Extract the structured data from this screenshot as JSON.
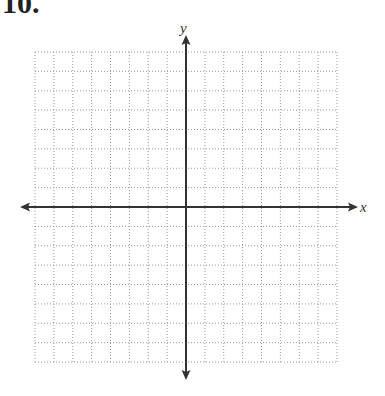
{
  "problem": {
    "number": "10."
  },
  "graph": {
    "x_axis_label": "x",
    "y_axis_label": "y",
    "grid": {
      "columns": 16,
      "rows": 16,
      "style": "dotted",
      "color": "#9a9a9a"
    },
    "axis_color": "#333333"
  },
  "chart_data": {
    "type": "scatter",
    "title": "",
    "xlabel": "x",
    "ylabel": "y",
    "xlim": [
      -8,
      8
    ],
    "ylim": [
      -8,
      8
    ],
    "grid": true,
    "series": []
  }
}
